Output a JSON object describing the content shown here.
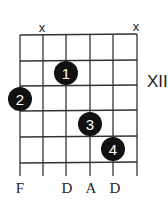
{
  "chord_diagram": {
    "position_label": "XII",
    "strings": 6,
    "frets_shown": 5,
    "muted_strings": [
      {
        "string_index": 1,
        "symbol": "x"
      },
      {
        "string_index": 5,
        "symbol": "x"
      }
    ],
    "fingers": [
      {
        "finger": "1",
        "string_index": 2,
        "fret": 1
      },
      {
        "finger": "2",
        "string_index": 0,
        "fret": 2
      },
      {
        "finger": "3",
        "string_index": 3,
        "fret": 3
      },
      {
        "finger": "4",
        "string_index": 4,
        "fret": 4
      }
    ],
    "note_labels": [
      {
        "string_index": 0,
        "note": "F"
      },
      {
        "string_index": 2,
        "note": "D"
      },
      {
        "string_index": 3,
        "note": "A"
      },
      {
        "string_index": 4,
        "note": "D"
      }
    ],
    "colors": {
      "lines": "#333333",
      "dots": "#111111",
      "dot_text": "#ffffff"
    }
  }
}
